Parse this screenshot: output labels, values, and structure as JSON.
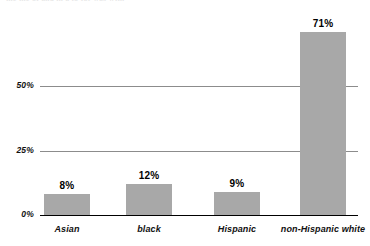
{
  "clipped_header_text": "the the of and in a to for was with",
  "chart_data": {
    "type": "bar",
    "title": "",
    "subtitle": "",
    "xlabel": "",
    "ylabel": "",
    "categories": [
      "Asian",
      "black",
      "Hispanic",
      "non-Hispanic white"
    ],
    "values": [
      8,
      12,
      9,
      71
    ],
    "value_labels": [
      "8%",
      "12%",
      "9%",
      "71%"
    ],
    "ylim": [
      0,
      77
    ],
    "yticks": [
      0,
      25,
      50
    ],
    "ytick_labels": [
      "0%",
      "25%",
      "50%"
    ],
    "grid": true,
    "legend": "none",
    "bar_color": "#a8a8a8",
    "gridline_color": "#8c8c8c",
    "axis_color": "#000000",
    "text_color": "#111111"
  }
}
